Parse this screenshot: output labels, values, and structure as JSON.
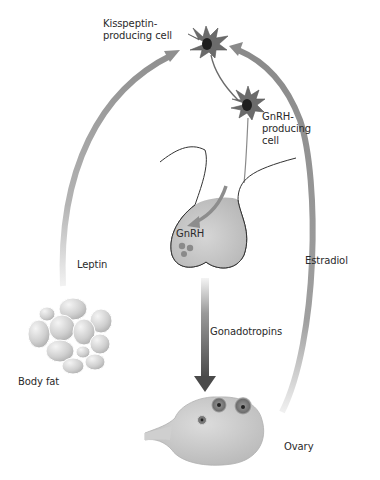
{
  "labels": {
    "kisspeptin_cell": "Kisspeptin-\nproducing cell",
    "gnrh_cell": "GnRH-\nproducing\ncell",
    "gnrh": "GnRH",
    "leptin": "Leptin",
    "estradiol": "Estradiol",
    "gonadotropins": "Gonadotropins",
    "body_fat": "Body fat",
    "ovary": "Ovary"
  },
  "colors": {
    "arrow": "#8a8a8a",
    "arrow_light": "#e6e6e6",
    "cell_body": "#6b6b6b",
    "nucleus": "#1e1e1e",
    "gland_fill": "#c8c8c8",
    "gonadotropin_arrow": "#555555"
  },
  "flows": [
    {
      "from": "Body fat",
      "to": "Kisspeptin-producing cell",
      "via": "Leptin"
    },
    {
      "from": "Kisspeptin-producing cell",
      "to": "GnRH-producing cell"
    },
    {
      "from": "GnRH-producing cell",
      "to": "Pituitary",
      "via": "GnRH"
    },
    {
      "from": "Pituitary",
      "to": "Ovary",
      "via": "Gonadotropins"
    },
    {
      "from": "Ovary",
      "to": "Kisspeptin-producing cell",
      "via": "Estradiol"
    }
  ]
}
